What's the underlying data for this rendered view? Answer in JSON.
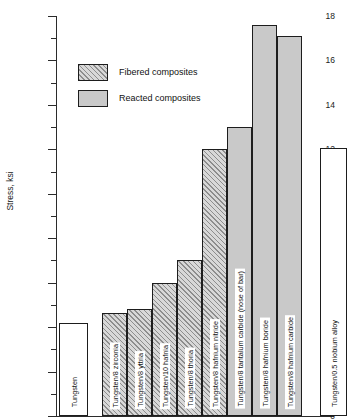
{
  "chart_data": {
    "type": "bar",
    "title": "",
    "xlabel": "",
    "ylabel": "Stress, ksi",
    "ylim": [
      0,
      18
    ],
    "ytick_step": 2,
    "yticks": [
      "0",
      "2",
      "4",
      "6",
      "8",
      "10",
      "12",
      "14",
      "16",
      "18"
    ],
    "minor_ticks": [
      1,
      3,
      5,
      7,
      9,
      11,
      13,
      15,
      17
    ],
    "grid": false,
    "legend_position": "upper-left-inside",
    "categories": [
      "Tungsten",
      "Tungsten/8 zirconia",
      "Tungsten/8 yttria",
      "Tungsten/10 hafnia",
      "Tungsten/8 thoria",
      "Tungsten/8 hafnium nitride",
      "Tungsten/8 tantalum carbide (nose of bar)",
      "Tungsten/8 hafnium boride",
      "Tungsten/8 hafnium carbide",
      "Tungsten/0.5 niobium alloy"
    ],
    "values": [
      4.2,
      4.65,
      4.8,
      6.0,
      7.0,
      12.0,
      13.0,
      17.6,
      17.1,
      12.05
    ],
    "kinds": [
      "plain",
      "fibered",
      "fibered",
      "fibered",
      "fibered",
      "fibered",
      "reacted",
      "reacted",
      "reacted",
      "plain"
    ],
    "legend": [
      {
        "label": "Fibered composites",
        "kind": "fibered"
      },
      {
        "label": "Reacted composites",
        "kind": "reacted"
      }
    ],
    "colors": {
      "axis": "#2b2b2b",
      "bar_outline": "#1d1d1d",
      "reacted_fill": "#c9c9c9",
      "fibered_fill": "#d8d8d8",
      "plain_fill": "#ffffff",
      "hatch": "#8d8d8d",
      "text": "#1a1a1a"
    }
  }
}
